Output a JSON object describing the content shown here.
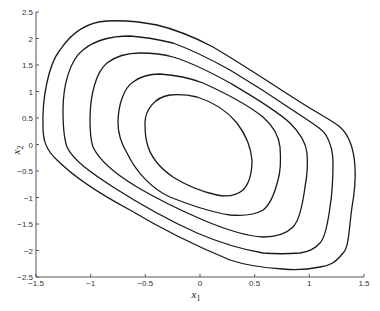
{
  "chart_data": {
    "type": "contour",
    "title": "",
    "xlabel": "x1",
    "ylabel": "x2",
    "xlim": [
      -1.5,
      1.5
    ],
    "ylim": [
      -2.5,
      2.5
    ],
    "grid": false,
    "legend": null,
    "x_ticks": [
      "-1.5",
      "-1",
      "-0.5",
      "0",
      "0.5",
      "1",
      "1.5"
    ],
    "y_ticks": [
      "2.5",
      "2",
      "1.5",
      "1",
      "0.5",
      "0",
      "-0.5",
      "-1",
      "-1.5",
      "-2",
      "-2.5"
    ],
    "contour_count": 5,
    "contours": [
      {
        "name": "level-1 (innermost)",
        "approx_extent": {
          "x": [
            -0.5,
            0.47
          ],
          "y": [
            -0.95,
            0.95
          ]
        }
      },
      {
        "name": "level-2",
        "approx_extent": {
          "x": [
            -0.75,
            0.73
          ],
          "y": [
            -1.33,
            1.33
          ]
        }
      },
      {
        "name": "level-3",
        "approx_extent": {
          "x": [
            -1.0,
            0.98
          ],
          "y": [
            -1.75,
            1.72
          ]
        }
      },
      {
        "name": "level-4",
        "approx_extent": {
          "x": [
            -1.25,
            1.23
          ],
          "y": [
            -2.05,
            2.05
          ]
        }
      },
      {
        "name": "level-5 (outermost)",
        "approx_extent": {
          "x": [
            -1.4,
            1.4
          ],
          "y": [
            -2.35,
            2.33
          ]
        }
      }
    ]
  }
}
